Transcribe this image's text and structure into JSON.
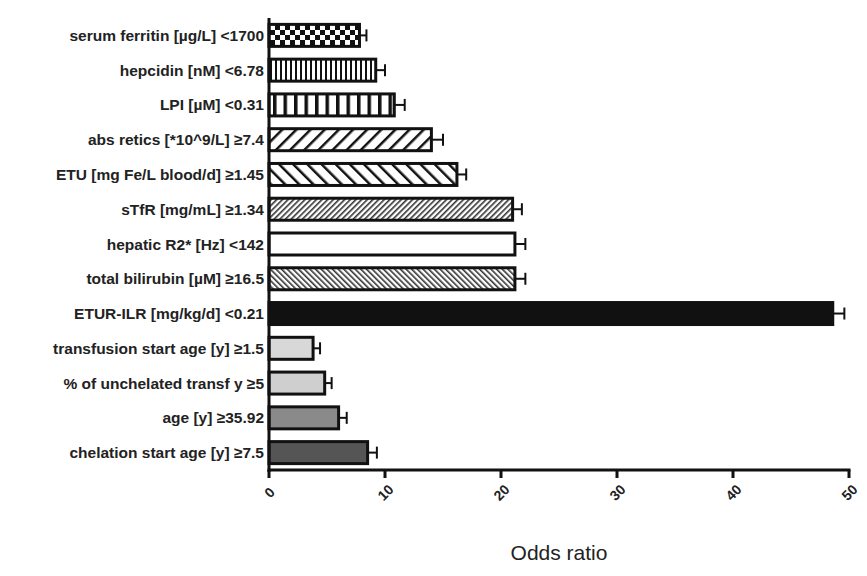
{
  "chart_data": {
    "type": "bar",
    "orientation": "horizontal",
    "title": "",
    "xlabel": "Odds ratio",
    "ylabel": "",
    "xlim": [
      0,
      50
    ],
    "xticks": [
      0,
      10,
      20,
      30,
      40,
      50
    ],
    "grid": false,
    "legend": null,
    "error_bars": true,
    "categories": [
      "serum ferritin [µg/L] <1700",
      "hepcidin [nM] <6.78",
      "LPI [µM] <0.31",
      "abs retics [*10^9/L] ≥7.4",
      "ETU [mg Fe/L blood/d] ≥1.45",
      "sTfR [mg/mL] ≥1.34",
      "hepatic R2* [Hz] <142",
      "total bilirubin [µM] ≥16.5",
      "ETUR-ILR [mg/kg/d] <0.21",
      "transfusion start age [y] ≥1.5",
      "% of unchelated transf y ≥5",
      "age [y] ≥35.92",
      "chelation start age [y] ≥7.5"
    ],
    "values": [
      7.8,
      9.2,
      10.8,
      14.0,
      16.2,
      21.0,
      21.2,
      21.2,
      48.6,
      3.8,
      4.8,
      6.0,
      8.5
    ],
    "errors": [
      0.6,
      0.8,
      0.9,
      1.0,
      0.8,
      0.8,
      0.9,
      0.9,
      1.0,
      0.6,
      0.6,
      0.7,
      0.8
    ],
    "fills": [
      "checker",
      "fine-vertical",
      "wide-vertical",
      "wide-diagonal",
      "back-diagonal",
      "fine-diagonal",
      "white",
      "fine-back-diagonal",
      "#111111",
      "#d8d8d8",
      "#cfcfcf",
      "#8a8a8a",
      "#555555"
    ]
  }
}
